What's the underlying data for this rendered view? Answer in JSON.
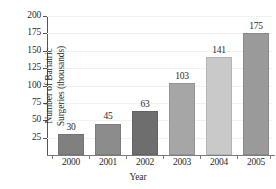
{
  "chart_data": {
    "type": "bar",
    "title": "",
    "xlabel": "Year",
    "ylabel_lines": [
      "Number of Bariatric",
      "Surgeries (thousands)"
    ],
    "ylabel": "Number of Bariatric Surgeries (thousands)",
    "categories": [
      "2000",
      "2001",
      "2002",
      "2003",
      "2004",
      "2005"
    ],
    "values": [
      30,
      45,
      63,
      103,
      141,
      175
    ],
    "value_labels": [
      "30",
      "45",
      "63",
      "103",
      "141",
      "175"
    ],
    "bar_colors": [
      "#808080",
      "#8c8c8c",
      "#6e6e6e",
      "#a6a6a6",
      "#c9c9c9",
      "#9a9a9a"
    ],
    "ylim": [
      0,
      200
    ],
    "ytick_step": 25,
    "yticks": [
      200,
      175,
      150,
      125,
      100,
      75,
      50,
      25
    ],
    "ytick_labels": [
      "200",
      "175",
      "150",
      "125",
      "100",
      "75",
      "50",
      "25"
    ],
    "grid": true,
    "grid_color": "#f1f1f1",
    "axis_color": "#555555",
    "legend": null,
    "legend_position": "none"
  }
}
